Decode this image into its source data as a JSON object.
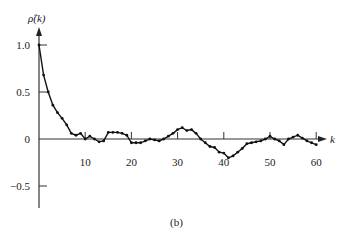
{
  "chart_data": {
    "type": "line",
    "title": "",
    "caption": "(b)",
    "xlabel": "k",
    "ylabel": "ρ̂(k)",
    "xlim": [
      0,
      62
    ],
    "ylim": [
      -0.75,
      1.1
    ],
    "xticks": [
      10,
      20,
      30,
      40,
      50,
      60
    ],
    "yticks": [
      1.0,
      0.5,
      0,
      -0.5
    ],
    "ytick_labels": [
      "1.0",
      "0.5",
      "0",
      "−0.5"
    ],
    "grid": false,
    "legend": null,
    "series": [
      {
        "name": "sample autocorrelation",
        "x": [
          0,
          1,
          2,
          3,
          4,
          5,
          6,
          7,
          8,
          9,
          10,
          11,
          12,
          13,
          14,
          15,
          16,
          17,
          18,
          19,
          20,
          21,
          22,
          23,
          24,
          25,
          26,
          27,
          28,
          29,
          30,
          31,
          32,
          33,
          34,
          35,
          36,
          37,
          38,
          39,
          40,
          41,
          42,
          43,
          44,
          45,
          46,
          47,
          48,
          49,
          50,
          51,
          52,
          53,
          54,
          55,
          56,
          57,
          58,
          59,
          60
        ],
        "values": [
          1.0,
          0.68,
          0.5,
          0.36,
          0.28,
          0.22,
          0.15,
          0.06,
          0.04,
          0.06,
          0.0,
          0.03,
          0.0,
          -0.03,
          -0.02,
          0.07,
          0.07,
          0.07,
          0.06,
          0.04,
          -0.04,
          -0.04,
          -0.04,
          -0.02,
          0.0,
          -0.01,
          -0.02,
          0.0,
          0.03,
          0.06,
          0.1,
          0.12,
          0.09,
          0.1,
          0.06,
          0.0,
          -0.04,
          -0.08,
          -0.09,
          -0.14,
          -0.15,
          -0.2,
          -0.18,
          -0.14,
          -0.1,
          -0.05,
          -0.04,
          -0.03,
          -0.02,
          0.0,
          0.03,
          0.0,
          -0.02,
          -0.06,
          0.0,
          0.02,
          0.04,
          0.01,
          -0.02,
          -0.04,
          -0.06
        ]
      }
    ]
  },
  "axes": {
    "y_label": "ρ̂(k)",
    "x_label": "k",
    "caption": "(b)"
  }
}
